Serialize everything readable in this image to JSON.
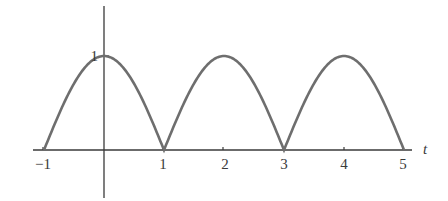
{
  "chart_data": {
    "type": "line",
    "title": "",
    "xlabel": "t",
    "ylabel": "",
    "function_description": "rectified cosine |cos(pi t / 2)|",
    "x": [
      -1,
      -0.5,
      0,
      0.5,
      1,
      1.5,
      2,
      2.5,
      3,
      3.5,
      4,
      4.5,
      5
    ],
    "series": [
      {
        "name": "f(t)",
        "values": [
          0,
          0.707,
          1,
          0.707,
          0,
          0.707,
          1,
          0.707,
          0,
          0.707,
          1,
          0.707,
          0
        ]
      }
    ],
    "xlim": [
      -1,
      5
    ],
    "ylim": [
      0,
      1
    ],
    "x_ticks": [
      "-1",
      "1",
      "2",
      "3",
      "4",
      "5"
    ],
    "y_ticks": [
      "1"
    ],
    "grid": false,
    "legend": null,
    "line_color": "#6a6a6a",
    "axis_color": "#3a3a3a"
  },
  "labels": {
    "x_var": "t",
    "y_one": "1",
    "xt": [
      "−1",
      "1",
      "2",
      "3",
      "4",
      "5"
    ]
  }
}
